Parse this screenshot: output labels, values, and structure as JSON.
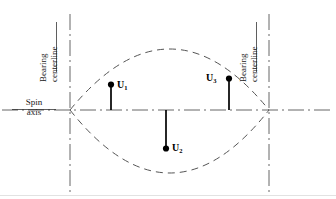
{
  "figure": {
    "type": "engineering-diagram",
    "background_color": "#ffffff",
    "line_color": "#555555",
    "vector_color": "#000000",
    "text_color": "#1a1a1a"
  },
  "axis": {
    "label_line1": "Spin",
    "label_line2": "axis",
    "y": 110,
    "x_start": 2,
    "x_end": 334
  },
  "bearings": [
    {
      "id": "left",
      "label_line1": "Bearing",
      "label_line2": "centerline",
      "x": 70
    },
    {
      "id": "right",
      "label_line1": "Bearing",
      "label_line2": "centerline",
      "x": 269
    }
  ],
  "mode_shape": {
    "style": "dashed",
    "left_node_x": 70,
    "right_node_x": 269,
    "top_peak_y": 50,
    "bottom_peak_y": 173,
    "center_x": 170
  },
  "vectors": [
    {
      "name": "U1",
      "label": "U",
      "subscript": "1",
      "x": 111,
      "tip_y": 85,
      "base_y": 110,
      "direction": "up",
      "label_position": "right"
    },
    {
      "name": "U2",
      "label": "U",
      "subscript": "2",
      "x": 166,
      "tip_y": 148,
      "base_y": 110,
      "direction": "down",
      "label_position": "right"
    },
    {
      "name": "U3",
      "label": "U",
      "subscript": "3",
      "x": 229,
      "tip_y": 78,
      "base_y": 110,
      "direction": "up",
      "label_position": "left"
    }
  ],
  "footer": {
    "separator_visible": true,
    "separator_y": 195
  }
}
